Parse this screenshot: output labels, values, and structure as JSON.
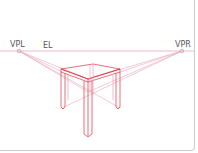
{
  "diagram": {
    "type": "two-point perspective drawing of a table",
    "labels": {
      "vpl": "VPL",
      "el": "EL",
      "vpr": "VPR"
    },
    "colors": {
      "horizon": "#f2b8c6",
      "construction": "#e8a0b4",
      "object": "#e0303c",
      "label": "#555555",
      "border": "#c9d0d6"
    }
  }
}
